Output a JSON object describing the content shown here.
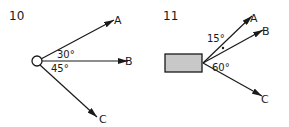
{
  "figures": [
    {
      "number": "10",
      "origin_shape": "circle",
      "vectors": [
        {
          "label": "A"
        },
        {
          "label": "B"
        },
        {
          "label": "C"
        }
      ],
      "angles": [
        "30°",
        "45°"
      ]
    },
    {
      "number": "11",
      "origin_shape": "rectangle",
      "vectors": [
        {
          "label": "A"
        },
        {
          "label": "B"
        },
        {
          "label": "C"
        }
      ],
      "angles": [
        "15°",
        "60°"
      ]
    }
  ],
  "colors": {
    "stroke": "#1a1a1a",
    "block_fill": "#c8c8c8"
  }
}
